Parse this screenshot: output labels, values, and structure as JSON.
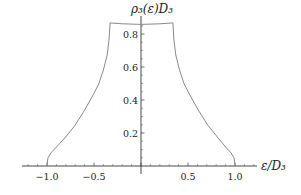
{
  "chart_data": {
    "type": "line",
    "title": "",
    "xlabel": "ε/D₃",
    "ylabel": "ρ₃(ε)D₃",
    "xlim": [
      -1.25,
      1.22
    ],
    "ylim": [
      0,
      0.87
    ],
    "grid": false,
    "legend": null,
    "x_ticks": [
      -1.0,
      -0.5,
      0.5,
      1.0
    ],
    "x_tick_labels": [
      "−1.0",
      "−0.5",
      "0.5",
      "1.0"
    ],
    "y_ticks": [
      0.2,
      0.4,
      0.6,
      0.8
    ],
    "y_tick_labels": [
      "0.2",
      "0.4",
      "0.6",
      "0.8"
    ],
    "series": [
      {
        "name": "rho3",
        "color": "#8a8a8a",
        "x": [
          -1.0,
          -0.99,
          -0.96,
          -0.91,
          -0.81,
          -0.7,
          -0.6,
          -0.51,
          -0.45,
          -0.4,
          -0.36,
          -0.34,
          -0.33,
          -0.33,
          -0.2,
          0.0,
          0.2,
          0.34,
          0.34,
          0.35,
          0.37,
          0.41,
          0.46,
          0.52,
          0.61,
          0.71,
          0.82,
          0.91,
          0.96,
          0.99,
          1.0
        ],
        "y": [
          0.0,
          0.048,
          0.079,
          0.109,
          0.17,
          0.248,
          0.339,
          0.43,
          0.497,
          0.582,
          0.673,
          0.764,
          0.855,
          0.867,
          0.862,
          0.858,
          0.862,
          0.867,
          0.855,
          0.764,
          0.673,
          0.582,
          0.497,
          0.43,
          0.339,
          0.248,
          0.17,
          0.109,
          0.079,
          0.048,
          0.0
        ]
      }
    ]
  },
  "layout": {
    "origin_px": [
      141,
      166
    ],
    "x_px_per_unit": 94,
    "y_px_per_unit": 165,
    "x_axis_px": [
      22,
      257
    ],
    "y_axis_top_px": 16
  }
}
